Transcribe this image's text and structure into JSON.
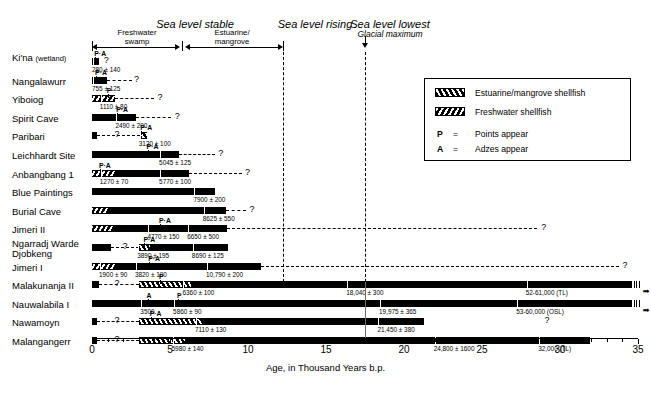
{
  "figure": {
    "axis_title": "Age, in Thousand Years b.p.",
    "x_min": 0,
    "x_max": 35,
    "x_ticks": [
      "0",
      "5",
      "10",
      "15",
      "20",
      "25",
      "30",
      "35"
    ],
    "glacial_max_x": 18
  },
  "phases": [
    {
      "title": "Sea level stable",
      "subtitle": ""
    },
    {
      "title": "Sea level rising",
      "subtitle": ""
    },
    {
      "title": "Sea level lowest",
      "subtitle": "Glacial maximum"
    }
  ],
  "subzones": [
    {
      "label_line1": "Freshwater",
      "label_line2": "swamp"
    },
    {
      "label_line1": "Estuarine/",
      "label_line2": "mangrove"
    }
  ],
  "legend": {
    "items": [
      {
        "swatch": "estuarine",
        "label": "Estuarine/mangrove shellfish"
      },
      {
        "swatch": "freshwater",
        "label": "Freshwater shellfish"
      }
    ],
    "keys": [
      {
        "symbol": "P",
        "eq": "=",
        "label": "Points appear"
      },
      {
        "symbol": "A",
        "eq": "=",
        "label": "Adzes appear"
      }
    ]
  },
  "chart_data": {
    "type": "bar",
    "title": "",
    "xlabel": "Age, in Thousand Years b.p.",
    "ylabel": "",
    "xlim": [
      0,
      35
    ],
    "grid": false,
    "orientation": "horizontal",
    "categories": [
      "Ki'na (wetland)",
      "Nangalawurr",
      "Yiboiog",
      "Spirit Cave",
      "Paribari",
      "Leichhardt Site",
      "Anbangbang 1",
      "Blue Paintings",
      "Burial Cave",
      "Jimeri II",
      "Ngarradj Warde Djobkeng",
      "Jimeri I",
      "Malakunanja II",
      "Nauwalabila I",
      "Nawamoyn",
      "Malangangerr"
    ],
    "sites": [
      {
        "name": "Ki'na (wetland)",
        "label_lines": [
          "Ki'na",
          "(wetland)"
        ],
        "segments": [
          {
            "type": "solid",
            "x0": 0,
            "x1": 0.42
          }
        ],
        "dashed": null,
        "question_marks": [
          0.75
        ],
        "dates": [
          {
            "text": "280 ± 140",
            "x": 0.0,
            "anchor": "left"
          }
        ],
        "markers": [
          {
            "text": "P·A",
            "x": 0.15
          }
        ],
        "continues": false
      },
      {
        "name": "Nangalawurr",
        "label_lines": [
          "Nangalawurr"
        ],
        "segments": [
          {
            "type": "solid",
            "x0": 0,
            "x1": 0.95
          }
        ],
        "dashed": {
          "x0": 0.95,
          "x1": 2.55
        },
        "question_marks": [
          2.7
        ],
        "dates": [
          {
            "text": "755 ± 125",
            "x": 0.0,
            "anchor": "left"
          }
        ],
        "markers": [
          {
            "text": "P·A",
            "x": 0.2
          }
        ],
        "continues": false
      },
      {
        "name": "Yiboiog",
        "label_lines": [
          "Yiboiog"
        ],
        "segments": [
          {
            "type": "freshwater",
            "x0": 0,
            "x1": 1.45
          }
        ],
        "dashed": {
          "x0": 1.45,
          "x1": 4.0
        },
        "question_marks": [
          4.2
        ],
        "dates": [
          {
            "text": "1110 ± 80",
            "x": 0.5,
            "anchor": "left"
          }
        ],
        "markers": [
          {
            "text": "P",
            "x": 0.95
          }
        ],
        "continues": false
      },
      {
        "name": "Spirit Cave",
        "label_lines": [
          "Spirit Cave"
        ],
        "segments": [
          {
            "type": "solid",
            "x0": 0,
            "x1": 2.85
          }
        ],
        "dashed": {
          "x0": 2.85,
          "x1": 5.05
        },
        "question_marks": [
          5.3
        ],
        "dates": [
          {
            "text": "2490 ± 200",
            "x": 1.5,
            "anchor": "left"
          }
        ],
        "markers": [
          {
            "text": "P·A",
            "x": 1.55
          }
        ],
        "continues": false
      },
      {
        "name": "Paribari",
        "label_lines": [
          "Paribari"
        ],
        "segments": [
          {
            "type": "solid",
            "x0": 0,
            "x1": 0.3
          },
          {
            "type": "estuarine",
            "x0": 3.05,
            "x1": 3.55
          }
        ],
        "dashed": {
          "x0": 0.3,
          "x1": 3.05
        },
        "question_marks": [
          1.45
        ],
        "dates": [
          {
            "text": "3120 ± 100",
            "x": 3.0,
            "anchor": "left"
          }
        ],
        "markers": [
          {
            "text": "P·A",
            "x": 3.1
          }
        ],
        "continues": false
      },
      {
        "name": "Leichhardt Site",
        "label_lines": [
          "Leichhardt Site"
        ],
        "segments": [
          {
            "type": "solid",
            "x0": 0,
            "x1": 5.55
          }
        ],
        "dashed": {
          "x0": 5.55,
          "x1": 7.9
        },
        "question_marks": [
          8.1
        ],
        "dates": [
          {
            "text": "5045 ± 125",
            "x": 4.3,
            "anchor": "left"
          }
        ],
        "markers": [
          {
            "text": "P·A",
            "x": 3.5
          }
        ],
        "continues": false
      },
      {
        "name": "Anbangbang 1",
        "label_lines": [
          "Anbangbang 1"
        ],
        "segments": [
          {
            "type": "freshwater",
            "x0": 0,
            "x1": 1.45
          },
          {
            "type": "solid",
            "x0": 1.45,
            "x1": 6.2
          }
        ],
        "dashed": {
          "x0": 6.2,
          "x1": 9.6
        },
        "question_marks": [
          9.8
        ],
        "dates": [
          {
            "text": "1270 ± 70",
            "x": 0.5,
            "anchor": "left"
          },
          {
            "text": "5770 ± 100",
            "x": 4.3,
            "anchor": "left"
          }
        ],
        "markers": [
          {
            "text": "P·A",
            "x": 0.45
          }
        ],
        "continues": false
      },
      {
        "name": "Blue Paintings",
        "label_lines": [
          "Blue Paintings"
        ],
        "segments": [
          {
            "type": "solid",
            "x0": 0,
            "x1": 7.9
          }
        ],
        "dashed": null,
        "question_marks": [],
        "dates": [
          {
            "text": "7900 ± 200",
            "x": 6.5,
            "anchor": "left"
          }
        ],
        "markers": [],
        "continues": false
      },
      {
        "name": "Burial Cave",
        "label_lines": [
          "Burial Cave"
        ],
        "segments": [
          {
            "type": "freshwater",
            "x0": 0,
            "x1": 1.0
          },
          {
            "type": "solid",
            "x0": 1.0,
            "x1": 8.6
          }
        ],
        "dashed": {
          "x0": 8.6,
          "x1": 9.9
        },
        "question_marks": [
          10.1
        ],
        "dates": [
          {
            "text": "8625 ± 550",
            "x": 7.1,
            "anchor": "left"
          }
        ],
        "markers": [],
        "continues": false
      },
      {
        "name": "Jimeri II",
        "label_lines": [
          "Jimeri II"
        ],
        "segments": [
          {
            "type": "freshwater",
            "x0": 0,
            "x1": 1.35
          },
          {
            "type": "solid",
            "x0": 1.35,
            "x1": 8.65
          }
        ],
        "dashed": {
          "x0": 8.65,
          "x1": 28.5
        },
        "question_marks": [
          28.8
        ],
        "dates": [
          {
            "text": "4770 ± 150",
            "x": 3.55,
            "anchor": "left"
          },
          {
            "text": "6650 ± 500",
            "x": 6.1,
            "anchor": "left"
          }
        ],
        "markers": [
          {
            "text": "P·A",
            "x": 4.3
          }
        ],
        "continues": false
      },
      {
        "name": "Ngarradj Warde Djobkeng",
        "label_lines": [
          "Ngarradj Warde",
          "Djobkeng"
        ],
        "segments": [
          {
            "type": "solid",
            "x0": 0,
            "x1": 1.2
          },
          {
            "type": "estuarine",
            "x0": 3.0,
            "x1": 3.7
          },
          {
            "type": "solid",
            "x0": 3.7,
            "x1": 8.75
          }
        ],
        "dashed": {
          "x0": 1.2,
          "x1": 3.0
        },
        "question_marks": [
          1.95
        ],
        "dates": [
          {
            "text": "3890 ± 195",
            "x": 2.9,
            "anchor": "left"
          },
          {
            "text": "8690 ± 125",
            "x": 6.4,
            "anchor": "left"
          }
        ],
        "markers": [
          {
            "text": "P·A",
            "x": 3.3
          }
        ],
        "continues": false
      },
      {
        "name": "Jimeri I",
        "label_lines": [
          "Jimeri I"
        ],
        "segments": [
          {
            "type": "freshwater",
            "x0": 0,
            "x1": 1.5
          },
          {
            "type": "solid",
            "x0": 1.5,
            "x1": 10.85
          }
        ],
        "dashed": {
          "x0": 10.85,
          "x1": 33.8
        },
        "question_marks": [
          34.0
        ],
        "dates": [
          {
            "text": "1900 ± 90",
            "x": 0.45,
            "anchor": "left"
          },
          {
            "text": "3820 ± 100",
            "x": 2.75,
            "anchor": "left"
          },
          {
            "text": "10,790 ± 200",
            "x": 7.3,
            "anchor": "left"
          }
        ],
        "markers": [
          {
            "text": "P·A",
            "x": 3.6
          }
        ],
        "continues": false
      },
      {
        "name": "Malakunanja II",
        "label_lines": [
          "Malakunanja II"
        ],
        "segments": [
          {
            "type": "solid",
            "x0": 0,
            "x1": 0.45
          },
          {
            "type": "estuarine",
            "x0": 3.0,
            "x1": 6.35
          },
          {
            "type": "solid",
            "x0": 6.35,
            "x1": 34.6
          }
        ],
        "dashed": {
          "x0": 0.45,
          "x1": 3.0
        },
        "question_marks": [
          1.45
        ],
        "dates": [
          {
            "text": "6360 ± 100",
            "x": 5.8,
            "anchor": "left"
          },
          {
            "text": "18,040 ± 300",
            "x": 16.3,
            "anchor": "left"
          },
          {
            "text": "52-61,000 (TL)",
            "x": 27.8,
            "anchor": "left"
          }
        ],
        "markers": [
          {
            "text": "P",
            "x": 4.3
          }
        ],
        "continues": true
      },
      {
        "name": "Nauwalabila I",
        "label_lines": [
          "Nauwalabila I"
        ],
        "segments": [
          {
            "type": "solid",
            "x0": 0,
            "x1": 34.6
          }
        ],
        "dashed": null,
        "question_marks": [],
        "dates": [
          {
            "text": "3500",
            "x": 3.1,
            "anchor": "left"
          },
          {
            "text": "5860 ± 90",
            "x": 5.2,
            "anchor": "left"
          },
          {
            "text": "19,975 ± 365",
            "x": 18.4,
            "anchor": "left"
          },
          {
            "text": "53-60,000 (OSL)",
            "x": 27.2,
            "anchor": "left"
          }
        ],
        "markers": [
          {
            "text": "A",
            "x": 3.5
          },
          {
            "text": "P",
            "x": 5.45
          }
        ],
        "continues": true
      },
      {
        "name": "Nawamoyn",
        "label_lines": [
          "Nawamoyn"
        ],
        "segments": [
          {
            "type": "solid",
            "x0": 0,
            "x1": 0.35
          },
          {
            "type": "estuarine",
            "x0": 3.0,
            "x1": 7.05
          },
          {
            "type": "solid",
            "x0": 7.05,
            "x1": 21.3
          }
        ],
        "dashed": {
          "x0": 0.35,
          "x1": 3.0
        },
        "question_marks": [
          1.45,
          29.0
        ],
        "dates": [
          {
            "text": "7110 ± 130",
            "x": 6.6,
            "anchor": "left"
          },
          {
            "text": "21,450 ± 380",
            "x": 18.3,
            "anchor": "left"
          }
        ],
        "markers": [
          {
            "text": "P·A",
            "x": 3.7
          }
        ],
        "continues": false
      },
      {
        "name": "Malangangerr",
        "label_lines": [
          "Malangangerr"
        ],
        "segments": [
          {
            "type": "solid",
            "x0": 0,
            "x1": 0.35
          },
          {
            "type": "estuarine",
            "x0": 3.0,
            "x1": 5.95
          },
          {
            "type": "solid",
            "x0": 5.95,
            "x1": 31.9
          }
        ],
        "dashed": {
          "x0": 0.35,
          "x1": 3.0
        },
        "question_marks": [
          1.45
        ],
        "dates": [
          {
            "text": "5980 ± 140",
            "x": 5.1,
            "anchor": "left"
          },
          {
            "text": "24,800 ± 1600",
            "x": 21.9,
            "anchor": "left"
          },
          {
            "text": "32,000 (TL)",
            "x": 28.6,
            "anchor": "left"
          }
        ],
        "markers": [],
        "continues": false
      }
    ]
  }
}
